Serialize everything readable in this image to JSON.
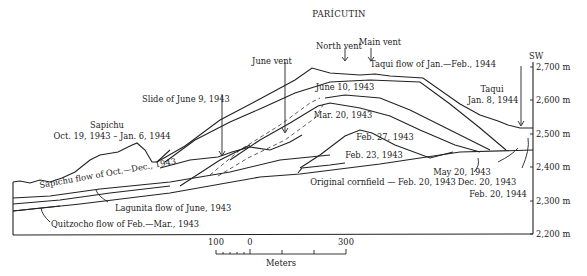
{
  "title": "PARÍCUTIN",
  "direction": "SW",
  "vents": [
    "North vent",
    "Main vent",
    "June vent"
  ],
  "labels": {
    "north_vent": "North vent",
    "main_vent": "Main vent",
    "june_vent": "June vent",
    "slide": "Slide of June 9, 1943",
    "sapichu_name": "Sapichu",
    "sapichu_dates": "Oct. 19, 1943 – Jan. 6, 1944",
    "june10": "June 10, 1943",
    "mar20": "Mar. 20, 1943",
    "feb27": "Feb. 27, 1943",
    "feb23": "Feb. 23, 1943",
    "cornfield": "Original cornfield — Feb. 20, 1943",
    "may20": "May 20, 1943",
    "dec20": "Dec. 20, 1943",
    "feb20_44": "Feb. 20, 1944",
    "taqui_flow": "Taqui flow of Jan.—Feb., 1944",
    "taqui_name": "Taqui",
    "taqui_date": "Jan. 8, 1944",
    "sapichu_flow": "Sapichu flow of Oct.—Dec., 1943",
    "lagunita_flow": "Lagunita flow of June, 1943",
    "quitzocho_flow": "Quitzocho flow of Feb.—Mar., 1943"
  },
  "elevation_axis": {
    "unit": "m",
    "ticks": [
      "2,700 m",
      "2,600 m",
      "2,500 m",
      "2,400 m",
      "2,300 m",
      "2,200 m"
    ]
  },
  "scale_bar": {
    "labels": [
      "100",
      "0",
      "300"
    ],
    "unit_label": "Meters"
  }
}
